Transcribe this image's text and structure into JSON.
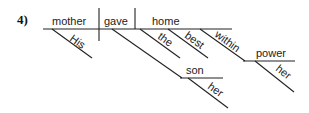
{
  "problem_number": "4)",
  "sentence_diagram": {
    "subject": "mother",
    "verb": "gave",
    "direct_object": "home",
    "subject_modifiers": [
      "His"
    ],
    "direct_object_modifiers": [
      "the",
      "best"
    ],
    "indirect_object": "son",
    "indirect_object_modifiers": [
      "her"
    ],
    "preposition": "within",
    "prepositional_object": "power",
    "prepositional_object_modifiers": [
      "her"
    ]
  }
}
